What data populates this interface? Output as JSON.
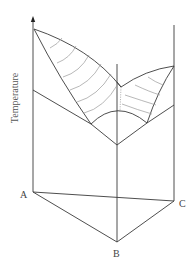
{
  "diagram": {
    "axis_label": "Temperature",
    "vertices": [
      {
        "id": "A",
        "label": "A"
      },
      {
        "id": "B",
        "label": "B"
      },
      {
        "id": "C",
        "label": "C"
      }
    ],
    "colors": {
      "edge": "#3a3a3a",
      "contour": "#9a9a9a",
      "background": "#ffffff"
    }
  }
}
